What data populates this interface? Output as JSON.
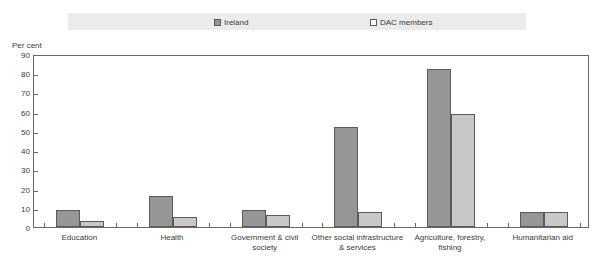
{
  "chart_data": {
    "type": "bar",
    "title": "",
    "subtitle": "",
    "xlabel": "",
    "ylabel": "Per cent",
    "ylim": [
      0,
      90
    ],
    "yticks": [
      0,
      10,
      20,
      30,
      40,
      50,
      60,
      70,
      80,
      90
    ],
    "grid": false,
    "legend_position": "top",
    "categories": [
      "Education",
      "Health",
      "Government & civil society",
      "Other social infrastructure & services",
      "Agriculture, forestry, fishing",
      "Humanitarian aid"
    ],
    "category_lines": [
      [
        "Education"
      ],
      [
        "Health"
      ],
      [
        "Government & civil society"
      ],
      [
        "Other social infrastructure",
        "& services"
      ],
      [
        "Agriculture, forestry,",
        "fishing"
      ],
      [
        "Humanitarian aid"
      ]
    ],
    "series": [
      {
        "name": "Ireland",
        "color": "#969696",
        "values": [
          9,
          16,
          9,
          52,
          82,
          8
        ]
      },
      {
        "name": "DAC members",
        "color": "#c8c8c8",
        "values": [
          3,
          5,
          6,
          8,
          59,
          8
        ]
      }
    ]
  },
  "legend": {
    "items": [
      {
        "label": "Ireland",
        "swatch": "ireland"
      },
      {
        "label": "DAC members",
        "swatch": "dac"
      }
    ]
  },
  "axis": {
    "y_title": "Per cent",
    "y_ticks": [
      "0",
      "10",
      "20",
      "30",
      "40",
      "50",
      "60",
      "70",
      "80",
      "90"
    ]
  },
  "colors": {
    "ireland": "#969696",
    "dac_members": "#c8c8c8",
    "frame": "#666666",
    "legend_band": "#ebebeb",
    "text": "#3a3a3a"
  }
}
